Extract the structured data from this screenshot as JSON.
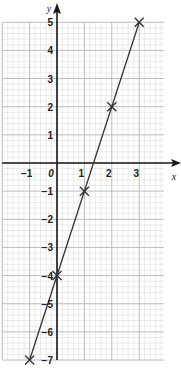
{
  "chart_data": {
    "type": "line",
    "title": "",
    "xlabel": "x",
    "ylabel": "y",
    "xlim": [
      -2,
      3.9
    ],
    "ylim": [
      -7,
      5
    ],
    "grid": true,
    "x_ticks": [
      "-1",
      "0",
      "1",
      "2",
      "3"
    ],
    "y_ticks": [
      "5",
      "4",
      "3",
      "2",
      "1",
      "-1",
      "-2",
      "-3",
      "-4",
      "-5",
      "-6",
      "-7"
    ],
    "origin_label": "0",
    "series": [
      {
        "name": "y = 3x - 4",
        "points": [
          {
            "x": -1,
            "y": -7
          },
          {
            "x": 0,
            "y": -4
          },
          {
            "x": 1,
            "y": -1
          },
          {
            "x": 2,
            "y": 2
          },
          {
            "x": 3,
            "y": 5
          }
        ],
        "marker": "x",
        "color": "#333333"
      }
    ]
  },
  "colors": {
    "grid_minor": "#d9d9d9",
    "grid_major": "#b5b5b5",
    "axis": "#1a1a1a",
    "line": "#333333"
  }
}
